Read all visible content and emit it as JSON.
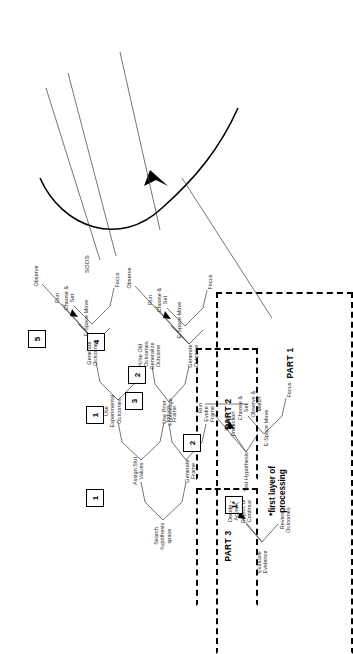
{
  "figure": {
    "title": "SDDS",
    "model_label": "SDDS",
    "callout": "*first layer of\nprocessing"
  },
  "parts": [
    {
      "id": "part1",
      "label": "PART 1"
    },
    {
      "id": "part2",
      "label": "PART 2"
    },
    {
      "id": "part3",
      "label": "PART 3"
    }
  ],
  "numbered_boxes": [
    {
      "id": "nb-1star",
      "label": "1*",
      "part": "PART 1"
    },
    {
      "id": "nb-p1-2",
      "label": "2",
      "part": "PART 1"
    },
    {
      "id": "nb-p1-3",
      "label": "3",
      "part": "PART 1"
    },
    {
      "id": "nb-p1-4",
      "label": "4",
      "part": "PART 1"
    },
    {
      "id": "nb-p1-5",
      "label": "5",
      "part": "PART 1"
    },
    {
      "id": "nb-p2-1",
      "label": "1",
      "part": "PART 2"
    },
    {
      "id": "nb-p2-2",
      "label": "2",
      "part": "PART 2"
    },
    {
      "id": "nb-p3-1",
      "label": "1",
      "part": "PART 3"
    }
  ],
  "part1": {
    "root": "Search\nhypothesis\nspace",
    "nodes": {
      "assign_slot_values": "Assign Slot\nValues",
      "generate_frame": "Generate\nFrame",
      "use_experimental_outcomes": "Use\nExperimental\nOutcomes",
      "use_prior_knowledge": "Use Prior\nKnowledge",
      "induce_frame": "Induce\nFrame",
      "evoke_frame": "Evoke\nFrame",
      "use_old_outcomes": "Use Old\nOutcomes",
      "generate_outcomes_upper": "Generate\nOutcomes",
      "generalize_outcome": "Generalize\nOutcome",
      "generate_outcome_lower": "Generate\nOutcome",
      "espace_move_upper": "E-Space  Move",
      "run_upper": "Run",
      "observe_upper": "Observe",
      "espace_move_lower": "E-Space  Move",
      "run_lower": "Run",
      "observe_lower": "Observe",
      "focus_upper": "Focus",
      "choose_set_upper": "Choose &\nSet",
      "focus_lower": "Focus",
      "choose_set_lower": "Choose &\nSet"
    }
  },
  "part2": {
    "root": "Test Hypothesis",
    "nodes": {
      "make_prediction": "Make\nPrediction",
      "run": "Run",
      "observe_match": "Observe &\nMatch",
      "espace_move": "E-Space  Move",
      "focus": "Focus",
      "choose_set": "Choose &\nSet"
    }
  },
  "part3": {
    "root": "Evaluate\nEvidence",
    "nodes": {
      "review_outcomes": "Review\nOutcomes",
      "decide": "Decide –\nAccept,\nReject, or\nContinue"
    }
  },
  "colors": {
    "ink": "#1a1a1a",
    "line": "#3a3a3a",
    "frame": "#000000",
    "background": "#ffffff"
  }
}
